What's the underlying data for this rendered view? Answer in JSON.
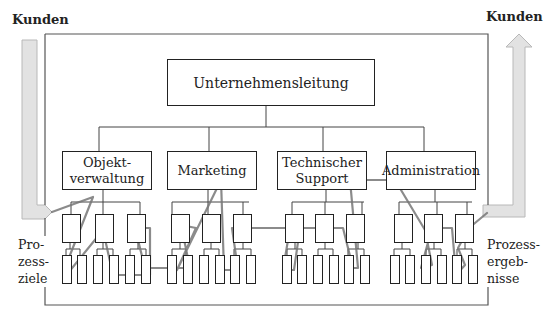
{
  "labels": {
    "kunden_left": "Kunden",
    "kunden_right": "Kunden",
    "prozessziele": [
      "Pro-",
      "zess-",
      "ziele"
    ],
    "prozessergebnisse": [
      "Prozess-",
      "ergeb-",
      "nisse"
    ]
  },
  "top": {
    "label": "Unternehmensleitung"
  },
  "departments": [
    {
      "label_lines": [
        "Objekt-",
        "verwaltung"
      ]
    },
    {
      "label_lines": [
        "Marketing"
      ]
    },
    {
      "label_lines": [
        "Technischer",
        "Support"
      ]
    },
    {
      "label_lines": [
        "Administration"
      ]
    }
  ],
  "colors": {
    "arrow_fill": "#e2e2e2",
    "arrow_stroke": "#b8b8b8",
    "process_line": "#777777",
    "box_border": "#222222"
  }
}
